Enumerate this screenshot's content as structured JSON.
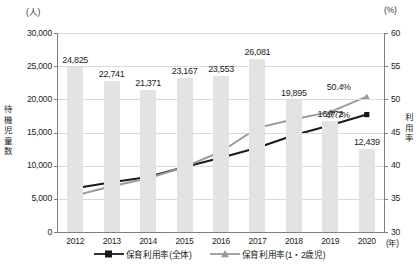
{
  "chart_data": {
    "type": "bar",
    "title": "",
    "subtitle": "",
    "categories": [
      "2012",
      "2013",
      "2014",
      "2015",
      "2016",
      "2017",
      "2018",
      "2019",
      "2020"
    ],
    "xlabel": "(年)",
    "ylabel_left": "待機児童数",
    "ylabel_right": "利用率",
    "unit_left": "(人)",
    "unit_right": "(%)",
    "ylim_left": [
      0,
      30000
    ],
    "ylim_right": [
      30,
      60
    ],
    "yticks_left": [
      "30,000",
      "25,000",
      "20,000",
      "15,000",
      "10,000",
      "5,000",
      "0"
    ],
    "yticks_right": [
      "60",
      "55",
      "50",
      "45",
      "40",
      "35",
      "30"
    ],
    "grid": true,
    "legend_position": "bottom",
    "series": [
      {
        "name": "待機児童数",
        "type": "bar",
        "axis": "left",
        "color": "#e3e3e3",
        "values": [
          24825,
          22741,
          21371,
          23167,
          23553,
          26081,
          19895,
          16772,
          12439
        ],
        "labels": [
          "24,825",
          "22,741",
          "21,371",
          "23,167",
          "23,553",
          "26,081",
          "19,895",
          "16,772",
          "12,439"
        ]
      },
      {
        "name": "保育利用率(全体)",
        "type": "line",
        "axis": "right",
        "color": "#1a1a1a",
        "marker": "square",
        "values": [
          36.6,
          37.5,
          38.3,
          39.8,
          41.2,
          42.7,
          44.6,
          46.1,
          47.7
        ],
        "end_label": "47.7%"
      },
      {
        "name": "保育利用率(1・2歳児)",
        "type": "line",
        "axis": "right",
        "color": "#9a9a9a",
        "marker": "triangle",
        "values": [
          35.5,
          36.9,
          38.1,
          39.8,
          42.1,
          45.7,
          47.0,
          48.1,
          50.4
        ],
        "end_label": "50.4%"
      }
    ]
  },
  "legend": {
    "items": [
      {
        "label": "保育利用率(全体)",
        "marker": "square-black"
      },
      {
        "label": "保育利用率(1・2歳児)",
        "marker": "triangle-gray"
      }
    ]
  }
}
